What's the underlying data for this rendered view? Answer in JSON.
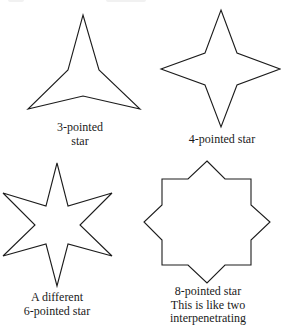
{
  "figure": {
    "background": "#ffffff",
    "stroke_color": "#1c1c1c",
    "stars": [
      {
        "id": "star-3",
        "points_count": 3,
        "caption_lines": [
          "3-pointed",
          "star"
        ],
        "vertices": [
          [
            83,
            15
          ],
          [
            99,
            70
          ],
          [
            140,
            109
          ],
          [
            83,
            96
          ],
          [
            28,
            109
          ],
          [
            68,
            70
          ]
        ]
      },
      {
        "id": "star-4",
        "points_count": 4,
        "caption_lines": [
          "4-pointed star"
        ],
        "vertices": [
          [
            221,
            10
          ],
          [
            237,
            53
          ],
          [
            280,
            69
          ],
          [
            237,
            85
          ],
          [
            221,
            127
          ],
          [
            205,
            85
          ],
          [
            161,
            69
          ],
          [
            205,
            53
          ]
        ]
      },
      {
        "id": "star-6",
        "points_count": 6,
        "caption_lines": [
          "A different",
          "6-pointed star"
        ],
        "vertices": [
          [
            57,
            163
          ],
          [
            68,
            206
          ],
          [
            112,
            193
          ],
          [
            80,
            225
          ],
          [
            112,
            256
          ],
          [
            68,
            244
          ],
          [
            57,
            286
          ],
          [
            46,
            244
          ],
          [
            3,
            256
          ],
          [
            35,
            225
          ],
          [
            3,
            193
          ],
          [
            46,
            206
          ]
        ]
      },
      {
        "id": "star-8",
        "points_count": 8,
        "caption_lines": [
          "8-pointed star",
          "This is like two",
          "interpenetrating"
        ],
        "vertices": [
          [
            207,
            161
          ],
          [
            225,
            179
          ],
          [
            251,
            179
          ],
          [
            251,
            205
          ],
          [
            270,
            222
          ],
          [
            251,
            240
          ],
          [
            251,
            265
          ],
          [
            225,
            265
          ],
          [
            207,
            283
          ],
          [
            188,
            265
          ],
          [
            162,
            265
          ],
          [
            162,
            240
          ],
          [
            144,
            222
          ],
          [
            162,
            205
          ],
          [
            162,
            179
          ],
          [
            188,
            179
          ]
        ]
      }
    ]
  }
}
